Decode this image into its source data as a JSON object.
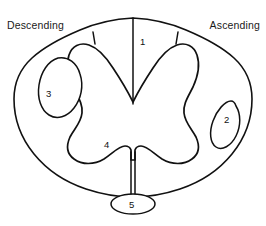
{
  "figure": {
    "background_color": "#ffffff",
    "line_color": "#111111"
  },
  "side_labels": {
    "left": "Descending",
    "right": "Ascending"
  },
  "region_numbers": {
    "dorsal_columns": "1",
    "lateral_right_tract": "2",
    "lateral_left_tract": "3",
    "ventral_gray_matter": "4",
    "ventral_oval": "5"
  }
}
